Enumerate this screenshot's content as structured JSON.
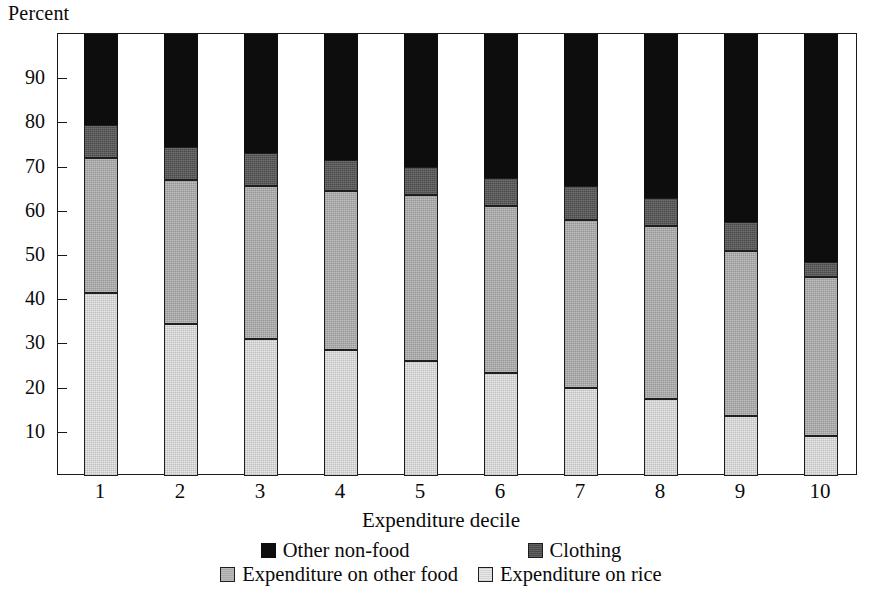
{
  "chart_data": {
    "type": "bar",
    "subtype": "stacked-bar-100",
    "title": "",
    "ylabel": "Percent",
    "xlabel": "Expenditure decile",
    "categories": [
      "1",
      "2",
      "3",
      "4",
      "5",
      "6",
      "7",
      "8",
      "9",
      "10"
    ],
    "ylim": [
      0,
      100
    ],
    "yticks": [
      "10",
      "20",
      "30",
      "40",
      "50",
      "60",
      "70",
      "80",
      "90"
    ],
    "ytick_values": [
      10,
      20,
      30,
      40,
      50,
      60,
      70,
      80,
      90
    ],
    "grid": false,
    "legend_position": "bottom",
    "series": [
      {
        "name": "Expenditure on rice",
        "color": "#e9e9e9",
        "values": [
          41.5,
          34.5,
          31.0,
          28.5,
          26.0,
          23.3,
          20.0,
          17.5,
          13.5,
          9.0
        ]
      },
      {
        "name": "Expenditure on other food",
        "color": "#a9a9a9",
        "values": [
          30.5,
          32.5,
          34.5,
          36.0,
          37.5,
          37.7,
          38.0,
          39.0,
          37.5,
          36.0
        ]
      },
      {
        "name": "Clothing",
        "color": "#4b4b4b",
        "values": [
          7.5,
          7.5,
          7.5,
          7.0,
          6.5,
          6.5,
          7.5,
          6.5,
          6.5,
          3.5
        ]
      },
      {
        "name": "Other non-food",
        "color": "#0d0d0d",
        "values": [
          20.5,
          25.5,
          27.0,
          28.5,
          30.0,
          32.5,
          34.5,
          37.0,
          42.5,
          51.5
        ]
      }
    ],
    "cumulative_tops": {
      "rice": [
        41.5,
        34.5,
        31.0,
        28.5,
        26.0,
        23.3,
        20.0,
        17.5,
        13.5,
        9.0
      ],
      "other_food": [
        72.0,
        67.0,
        65.5,
        64.5,
        63.5,
        61.0,
        58.0,
        56.5,
        51.0,
        45.0
      ],
      "clothing": [
        79.5,
        74.5,
        73.0,
        71.5,
        70.0,
        67.5,
        65.5,
        63.0,
        57.5,
        48.5
      ],
      "non_food": [
        100,
        100,
        100,
        100,
        100,
        100,
        100,
        100,
        100,
        100
      ]
    }
  },
  "legend": {
    "row1": [
      {
        "label": "Other non-food",
        "swatch": "sw-nonfood"
      },
      {
        "label": "Clothing",
        "swatch": "sw-clothing"
      }
    ],
    "row2": [
      {
        "label": "Expenditure on other food",
        "swatch": "sw-otherfood"
      },
      {
        "label": "Expenditure on rice",
        "swatch": "sw-rice"
      }
    ]
  }
}
